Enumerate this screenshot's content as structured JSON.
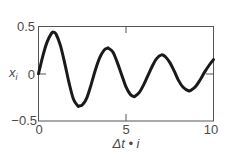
{
  "chart_data": {
    "type": "line",
    "title": "",
    "xlabel": "Δt • i",
    "ylabel": "x_i",
    "ylabel_main": "x",
    "ylabel_sub": "i",
    "xlim": [
      0,
      10
    ],
    "ylim": [
      -0.5,
      0.5
    ],
    "xticks": [
      0,
      5,
      10
    ],
    "xtick_labels": [
      "0",
      "5",
      "10"
    ],
    "yticks": [
      0.5,
      0,
      -0.5
    ],
    "ytick_labels": [
      "0.5",
      "0",
      "−0.5"
    ],
    "grid": false,
    "legend": null,
    "line_color": "#1a1a1a",
    "frame_color": "#555555",
    "series": [
      {
        "name": "x_i",
        "x": [
          0,
          0.25,
          0.5,
          0.75,
          0.86,
          1.0,
          1.25,
          1.5,
          1.75,
          2.0,
          2.25,
          2.34,
          2.5,
          2.75,
          3.0,
          3.25,
          3.5,
          3.75,
          3.94,
          4.0,
          4.25,
          4.5,
          4.75,
          5.0,
          5.25,
          5.43,
          5.5,
          5.75,
          6.0,
          6.25,
          6.5,
          6.75,
          7.03,
          7.25,
          7.5,
          7.75,
          8.0,
          8.25,
          8.57,
          8.75,
          9.0,
          9.25,
          9.5,
          9.75,
          10.0
        ],
        "values": [
          0,
          0.19,
          0.34,
          0.43,
          0.44,
          0.42,
          0.3,
          0.11,
          -0.1,
          -0.27,
          -0.34,
          -0.34,
          -0.33,
          -0.26,
          -0.12,
          0.04,
          0.17,
          0.25,
          0.27,
          0.27,
          0.23,
          0.12,
          -0.01,
          -0.14,
          -0.22,
          -0.24,
          -0.24,
          -0.2,
          -0.12,
          -0.02,
          0.08,
          0.16,
          0.2,
          0.18,
          0.12,
          0.03,
          -0.07,
          -0.14,
          -0.18,
          -0.17,
          -0.13,
          -0.06,
          0.02,
          0.09,
          0.15
        ]
      }
    ]
  }
}
